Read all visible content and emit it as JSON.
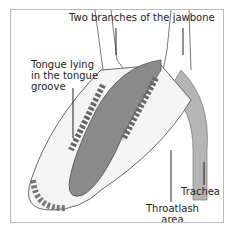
{
  "labels": {
    "jawbone": "Two branches of the jawbone",
    "tongue": [
      "Tongue lying",
      "in the tongue",
      "groove"
    ],
    "trachea": "Trachea",
    "throatlash": [
      "Throatlash",
      "area"
    ]
  },
  "colors": {
    "tongue": "#8a8a8a",
    "trachea": "#b5b5b5",
    "bone": "#f4f4f4",
    "outline": "#444444",
    "frame": "#bbbbbb"
  }
}
